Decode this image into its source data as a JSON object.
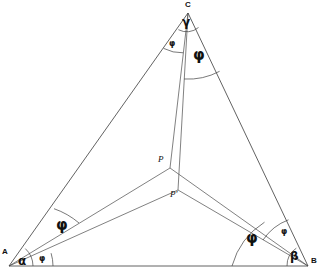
{
  "figure": {
    "background_color": "#ffffff",
    "line_color": "#3a3a3a",
    "text_color": "#111111",
    "width": 322,
    "height": 274
  },
  "vertices": [
    {
      "id": "A",
      "label": "A",
      "x": 9,
      "y": 266
    },
    {
      "id": "B",
      "label": "B",
      "x": 308,
      "y": 266
    },
    {
      "id": "C",
      "label": "C",
      "x": 188,
      "y": 13
    }
  ],
  "interior_points": [
    {
      "id": "P",
      "label": "P",
      "x": 170,
      "y": 168
    },
    {
      "id": "Pprime",
      "label": "P'",
      "x": 178,
      "y": 190
    }
  ],
  "edges": [
    {
      "id": "AB",
      "from": "A",
      "to": "B"
    },
    {
      "id": "BC",
      "from": "B",
      "to": "C"
    },
    {
      "id": "CA",
      "from": "C",
      "to": "A"
    }
  ],
  "cevians": [
    {
      "id": "AP",
      "from": "A",
      "to": "P"
    },
    {
      "id": "APprime",
      "from": "A",
      "to": "Pprime"
    },
    {
      "id": "BP",
      "from": "B",
      "to": "P"
    },
    {
      "id": "BPprime",
      "from": "B",
      "to": "Pprime"
    },
    {
      "id": "CP",
      "from": "C",
      "to": "P"
    },
    {
      "id": "CPprime",
      "from": "C",
      "to": "Pprime"
    }
  ],
  "angle_labels": [
    {
      "id": "alpha-A",
      "text": "α",
      "x": 19,
      "y": 256,
      "size": "greek-mid",
      "vertex": "A"
    },
    {
      "id": "phi-A-small",
      "text": "φ",
      "x": 39,
      "y": 255,
      "size": "greek-small",
      "vertex": "A"
    },
    {
      "id": "phi-A-big",
      "text": "φ",
      "x": 57,
      "y": 222,
      "size": "greek-big",
      "vertex": "A"
    },
    {
      "id": "beta-B",
      "text": "β",
      "x": 291,
      "y": 253,
      "size": "greek-mid",
      "vertex": "B"
    },
    {
      "id": "phi-B-small",
      "text": "φ",
      "x": 281,
      "y": 230,
      "size": "greek-small",
      "vertex": "B"
    },
    {
      "id": "phi-B-big",
      "text": "φ",
      "x": 247,
      "y": 235,
      "size": "greek-big",
      "vertex": "B"
    },
    {
      "id": "gamma-C",
      "text": "γ",
      "x": 183,
      "y": 18,
      "size": "greek-mid",
      "vertex": "C"
    },
    {
      "id": "phi-C-small",
      "text": "φ",
      "x": 170,
      "y": 43,
      "size": "greek-small",
      "vertex": "C"
    },
    {
      "id": "phi-C-big",
      "text": "φ",
      "x": 194,
      "y": 53,
      "size": "greek-big",
      "vertex": "C"
    }
  ],
  "point_labels": [
    {
      "id": "P-label",
      "text": "P",
      "x": 160,
      "y": 156
    },
    {
      "id": "Pprime-label",
      "text": "P'",
      "x": 172,
      "y": 192
    }
  ],
  "vertex_labels": [
    {
      "id": "A-label",
      "text": "A",
      "x": 2,
      "y": 250
    },
    {
      "id": "B-label",
      "text": "B",
      "x": 311,
      "y": 258
    },
    {
      "id": "C-label",
      "text": "C",
      "x": 185,
      "y": 1
    }
  ]
}
